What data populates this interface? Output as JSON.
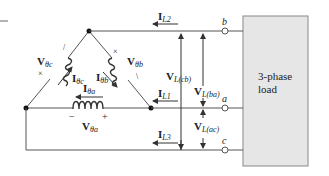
{
  "diagram": {
    "load_box": {
      "label_line1": "3-phase",
      "label_line2": "load",
      "fill": "#e6e6e6",
      "stroke": "#888888"
    },
    "wire_color": "#555555",
    "terminals": {
      "b": "b",
      "a": "a",
      "c": "c"
    },
    "phase_voltages": {
      "Vc": {
        "main": "V",
        "sub": "θc",
        "marks": [
          "×",
          "/"
        ]
      },
      "Vb": {
        "main": "V",
        "sub": "θb",
        "marks": [
          "×",
          "\\"
        ]
      },
      "Va": {
        "main": "V",
        "sub": "θa",
        "minus": "−",
        "plus": "+"
      }
    },
    "phase_currents": {
      "Ic": {
        "main": "I",
        "sub": "θc"
      },
      "Ib": {
        "main": "I",
        "sub": "θb"
      },
      "Ia": {
        "main": "I",
        "sub": "θa"
      }
    },
    "line_currents": {
      "IL1": {
        "main": "I",
        "sub": "L1"
      },
      "IL2": {
        "main": "I",
        "sub": "L2"
      },
      "IL3": {
        "main": "I",
        "sub": "L3"
      }
    },
    "line_voltages": {
      "Vcb": {
        "main": "V",
        "sub": "L(cb)"
      },
      "Vba": {
        "main": "V",
        "sub": "L(ba)"
      },
      "Vac": {
        "main": "V",
        "sub": "L(ac)"
      }
    }
  }
}
